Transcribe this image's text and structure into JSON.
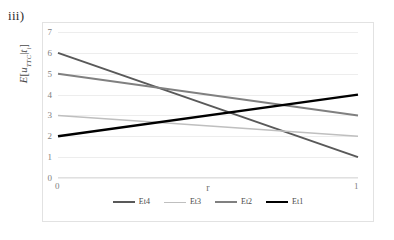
{
  "figure": {
    "label": "iii)"
  },
  "chart_data": {
    "type": "line",
    "title": "",
    "xlabel": "r",
    "ylabel": "E[u_TTC|t_i]",
    "ylabel_parts": {
      "e": "E",
      "bracket_open": "[",
      "u": "u",
      "u_sub": "TTC",
      "pipe": "|",
      "t": "t",
      "t_sub": "i",
      "bracket_close": "]"
    },
    "x": [
      0,
      1
    ],
    "xlim": [
      0,
      1
    ],
    "ylim": [
      0,
      7
    ],
    "xticks": [
      "0",
      "1"
    ],
    "yticks": [
      "0",
      "1",
      "2",
      "3",
      "4",
      "5",
      "6",
      "7"
    ],
    "grid": true,
    "legend_position": "bottom",
    "series": [
      {
        "name": "Et4",
        "values": [
          6,
          1
        ],
        "color": "#595959",
        "width": 2.0
      },
      {
        "name": "Et3",
        "values": [
          3,
          2
        ],
        "color": "#bfbfbf",
        "width": 1.6
      },
      {
        "name": "Et2",
        "values": [
          5,
          3
        ],
        "color": "#808080",
        "width": 2.0
      },
      {
        "name": "Et1",
        "values": [
          2,
          4
        ],
        "color": "#000000",
        "width": 2.4
      }
    ]
  },
  "legend": {
    "items": [
      {
        "label": "Et4"
      },
      {
        "label": "Et3"
      },
      {
        "label": "Et2"
      },
      {
        "label": "Et1"
      }
    ]
  }
}
